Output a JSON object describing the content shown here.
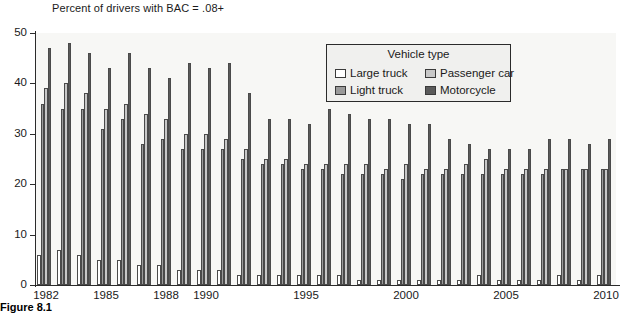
{
  "figure": {
    "caption": "Figure 8.1"
  },
  "legend": {
    "title": "Vehicle type",
    "items": [
      {
        "label": "Large truck",
        "color": "#ffffff",
        "key": "large_truck"
      },
      {
        "label": "Passenger car",
        "color": "#c8c8c8",
        "key": "passenger_car"
      },
      {
        "label": "Light truck",
        "color": "#9a9a9a",
        "key": "light_truck"
      },
      {
        "label": "Motorcycle",
        "color": "#5a5a5a",
        "key": "motorcycle"
      }
    ]
  },
  "chart_data": {
    "type": "bar",
    "title": "Percent of drivers with BAC = .08+",
    "xlabel": "",
    "ylabel": "",
    "ylim": [
      0,
      50
    ],
    "yticks": [
      0,
      10,
      20,
      30,
      40,
      50
    ],
    "grid": false,
    "legend_position": "upper-center-right",
    "categories": [
      "1982",
      "1983",
      "1984",
      "1985",
      "1986",
      "1987",
      "1988",
      "1989",
      "1990",
      "1991",
      "1992",
      "1993",
      "1994",
      "1995",
      "1996",
      "1997",
      "1998",
      "1999",
      "2000",
      "2001",
      "2002",
      "2003",
      "2004",
      "2005",
      "2006",
      "2007",
      "2008",
      "2009",
      "2010"
    ],
    "xtick_labels": [
      "1982",
      "1985",
      "1988",
      "1990",
      "1995",
      "2000",
      "2005",
      "2010"
    ],
    "series": [
      {
        "name": "Large truck",
        "color": "#ffffff",
        "values": [
          6,
          7,
          6,
          5,
          5,
          4,
          4,
          3,
          3,
          3,
          2,
          2,
          2,
          2,
          2,
          2,
          1,
          1,
          1,
          1,
          1,
          1,
          2,
          1,
          1,
          1,
          2,
          1,
          2
        ]
      },
      {
        "name": "Light truck",
        "color": "#9a9a9a",
        "values": [
          36,
          35,
          35,
          31,
          33,
          28,
          29,
          27,
          27,
          27,
          25,
          24,
          24,
          23,
          23,
          22,
          22,
          22,
          21,
          22,
          22,
          22,
          22,
          22,
          22,
          22,
          23,
          23,
          23
        ]
      },
      {
        "name": "Passenger car",
        "color": "#c8c8c8",
        "values": [
          39,
          40,
          38,
          35,
          36,
          34,
          33,
          30,
          30,
          29,
          27,
          25,
          25,
          24,
          24,
          24,
          24,
          23,
          24,
          23,
          23,
          24,
          25,
          23,
          23,
          23,
          23,
          23,
          23
        ]
      },
      {
        "name": "Motorcycle",
        "color": "#5a5a5a",
        "values": [
          47,
          48,
          46,
          43,
          46,
          43,
          41,
          44,
          43,
          44,
          38,
          33,
          33,
          32,
          35,
          34,
          33,
          33,
          32,
          32,
          29,
          28,
          27,
          27,
          27,
          29,
          29,
          28,
          29
        ]
      }
    ]
  }
}
